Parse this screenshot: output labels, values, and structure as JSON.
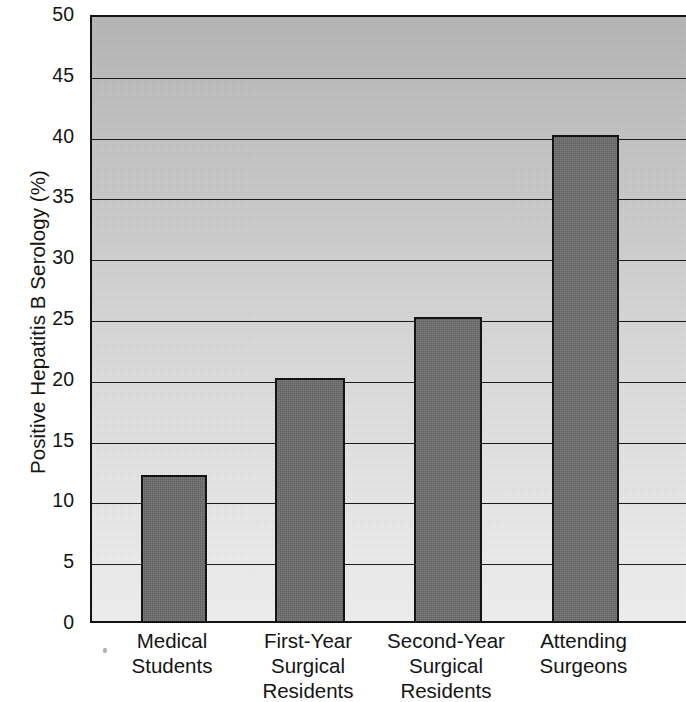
{
  "chart_data": {
    "type": "bar",
    "title": "",
    "subtitle": "",
    "xlabel": "",
    "ylabel": "Positive Hepatitis B Serology (%)",
    "categories": [
      "Medical Students",
      "First-Year Surgical Residents",
      "Second-Year Surgical Residents",
      "Attending Surgeons"
    ],
    "category_lines": [
      [
        "Medical",
        "Students"
      ],
      [
        "First-Year",
        "Surgical",
        "Residents"
      ],
      [
        "Second-Year",
        "Surgical",
        "Residents"
      ],
      [
        "Attending",
        "Surgeons"
      ]
    ],
    "values": [
      12,
      20,
      25,
      40
    ],
    "ylim": [
      0,
      50
    ],
    "ytick_values": [
      0,
      5,
      10,
      15,
      20,
      25,
      30,
      35,
      40,
      45,
      50
    ],
    "ytick_labels": [
      "0",
      "5",
      "10",
      "15",
      "20",
      "25",
      "30",
      "35",
      "40",
      "45",
      "50"
    ],
    "grid": "horizontal",
    "legend": "none",
    "colors": {
      "bar_fill": "#6d6d6d",
      "bar_outline": "#141414",
      "axis": "#141414",
      "gridline": "#1c1c1c",
      "plot_background_top": "#b6b6b6",
      "plot_background_bottom": "#efefef",
      "page_background": "#ffffff",
      "text": "#141414"
    }
  }
}
